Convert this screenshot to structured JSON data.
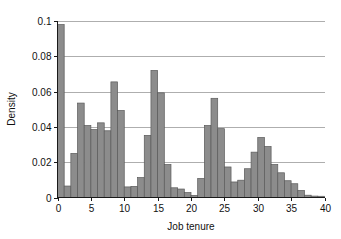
{
  "chart_data": {
    "type": "bar",
    "title": "",
    "subtitle": "",
    "xlabel": "Job tenure",
    "ylabel": "Density",
    "xlim": [
      0,
      40
    ],
    "ylim": [
      0,
      0.1
    ],
    "grid": "horizontal",
    "legend": "none",
    "bin_width": 1,
    "bar_color": "#8c8c8c",
    "bar_edge_color": "#5a5a5a",
    "xticks": [
      0,
      5,
      10,
      15,
      20,
      25,
      30,
      35,
      40
    ],
    "xtick_labels": [
      "0",
      "5",
      "10",
      "15",
      "20",
      "25",
      "30",
      "35",
      "40"
    ],
    "yticks": [
      0,
      0.02,
      0.04,
      0.06,
      0.08,
      0.1
    ],
    "ytick_labels": [
      "0",
      "0.02",
      "0.04",
      "0.06",
      "0.08",
      "0.1"
    ],
    "bin_starts": [
      0,
      1,
      2,
      3,
      4,
      5,
      6,
      7,
      8,
      9,
      10,
      11,
      12,
      13,
      14,
      15,
      16,
      17,
      18,
      19,
      20,
      21,
      22,
      23,
      24,
      25,
      26,
      27,
      28,
      29,
      30,
      31,
      32,
      33,
      34,
      35,
      36,
      37,
      38,
      39
    ],
    "categories": [
      "0",
      "1",
      "2",
      "3",
      "4",
      "5",
      "6",
      "7",
      "8",
      "9",
      "10",
      "11",
      "12",
      "13",
      "14",
      "15",
      "16",
      "17",
      "18",
      "19",
      "20",
      "21",
      "22",
      "23",
      "24",
      "25",
      "26",
      "27",
      "28",
      "29",
      "30",
      "31",
      "32",
      "33",
      "34",
      "35",
      "36",
      "37",
      "38",
      "39"
    ],
    "values": [
      0.098,
      0.0065,
      0.025,
      0.0535,
      0.0408,
      0.0385,
      0.0423,
      0.0378,
      0.0655,
      0.0493,
      0.006,
      0.0063,
      0.0113,
      0.0352,
      0.072,
      0.0593,
      0.0187,
      0.0055,
      0.0048,
      0.0028,
      0.0012,
      0.0108,
      0.0408,
      0.0562,
      0.039,
      0.0173,
      0.0088,
      0.0098,
      0.0163,
      0.0257,
      0.034,
      0.0289,
      0.0187,
      0.014,
      0.0095,
      0.0078,
      0.004,
      0.0013,
      0.0008,
      0.0007
    ]
  }
}
